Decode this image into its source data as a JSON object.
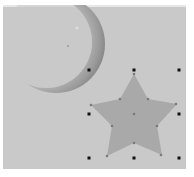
{
  "canvas": {
    "background": "#c9c9c9",
    "border_top": "#e6e6e6"
  },
  "shapes": [
    {
      "type": "crescent-moon",
      "fill_light": "#c4c4c4",
      "fill_dark": "#8a8a8a",
      "selected": false
    },
    {
      "type": "star",
      "points": 5,
      "fill": "#a9a9a9",
      "selected": true,
      "bounding_box": {
        "x": 89,
        "y": 70,
        "width": 90,
        "height": 88
      }
    }
  ],
  "selection": {
    "handle_color": "#111111",
    "point_handle_color": "#7a7a7a",
    "handles": [
      {
        "name": "top-left",
        "x": 89,
        "y": 70
      },
      {
        "name": "top-center",
        "x": 134,
        "y": 70
      },
      {
        "name": "top-right",
        "x": 179,
        "y": 70
      },
      {
        "name": "middle-left",
        "x": 89,
        "y": 114
      },
      {
        "name": "middle-right",
        "x": 179,
        "y": 114
      },
      {
        "name": "bottom-left",
        "x": 89,
        "y": 158
      },
      {
        "name": "bottom-center",
        "x": 134,
        "y": 158
      },
      {
        "name": "bottom-right",
        "x": 179,
        "y": 158
      }
    ]
  }
}
